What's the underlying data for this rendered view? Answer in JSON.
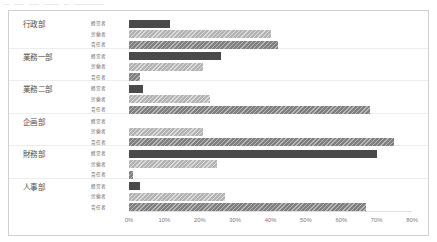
{
  "top_strip": {
    "fragments": [
      "—",
      "——",
      "——",
      "———",
      "—",
      "——————"
    ]
  },
  "chart_data": {
    "type": "bar",
    "orientation": "horizontal",
    "title": "",
    "xlabel": "",
    "ylabel": "",
    "xlim": [
      0,
      80
    ],
    "x_tick_labels": [
      "0%",
      "10%",
      "20%",
      "30%",
      "40%",
      "50%",
      "60%",
      "70%",
      "80%"
    ],
    "x_tick_values": [
      0,
      10,
      20,
      30,
      40,
      50,
      60,
      70,
      80
    ],
    "grid": false,
    "legend_position": "none",
    "categories": [
      "行政部",
      "業務一部",
      "業務二部",
      "企画部",
      "財務部",
      "人事部"
    ],
    "series": [
      {
        "name": "経\\u55b6者",
        "label": "経営者",
        "color": "#4a4a4a",
        "pattern": "solid",
        "values": [
          11.5,
          26.0,
          4.0,
          0.0,
          70.0,
          3.0
        ]
      },
      {
        "name": "労働者",
        "label": "労働者",
        "color": "#b3b3b3",
        "pattern": "diagonal-hatch",
        "values": [
          40.0,
          21.0,
          23.0,
          21.0,
          25.0,
          27.0
        ]
      },
      {
        "name": "責任者",
        "label": "責任者",
        "color": "#7f7f7f",
        "pattern": "diagonal-hatch",
        "values": [
          42.0,
          3.0,
          68.0,
          75.0,
          1.0,
          67.0
        ]
      }
    ]
  }
}
